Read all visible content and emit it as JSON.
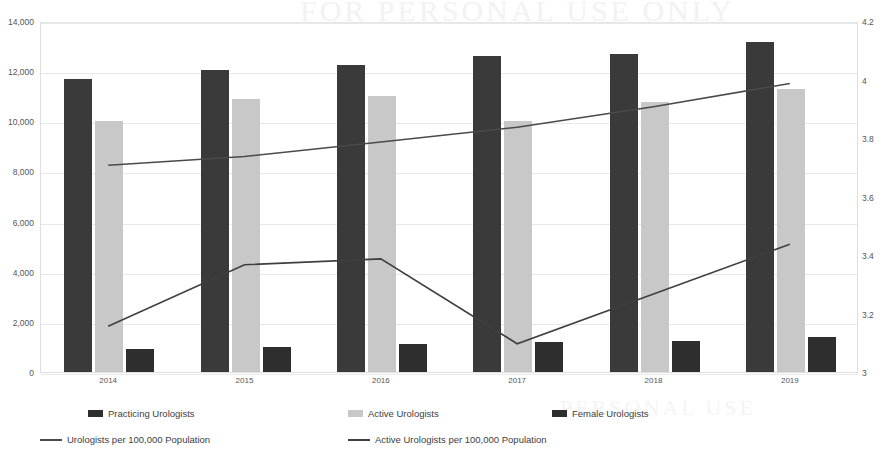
{
  "chart_data": {
    "type": "bar",
    "title": "",
    "xlabel": "",
    "ylabel": "",
    "categories": [
      "2014",
      "2015",
      "2016",
      "2017",
      "2018",
      "2019"
    ],
    "grid": true,
    "legend_position": "bottom",
    "axes": {
      "left": {
        "label": "",
        "ylim": [
          0,
          14000
        ],
        "ticks": [
          "0",
          "2,000",
          "4,000",
          "6,000",
          "8,000",
          "10,000",
          "12,000",
          "14,000"
        ],
        "tick_values": [
          0,
          2000,
          4000,
          6000,
          8000,
          10000,
          12000,
          14000
        ]
      },
      "right": {
        "label": "",
        "ylim": [
          3,
          4.2
        ],
        "ticks": [
          "3",
          "3.2",
          "3.4",
          "3.6",
          "3.8",
          "4",
          "4.2"
        ],
        "tick_values": [
          3,
          3.2,
          3.4,
          3.6,
          3.8,
          4.0,
          4.2
        ]
      }
    },
    "series": [
      {
        "name": "Practicing Urologists",
        "type": "bar",
        "axis": "left",
        "color": "#3a3a3a",
        "values": [
          11700,
          12050,
          12250,
          12600,
          12700,
          13150
        ]
      },
      {
        "name": "Active Urologists",
        "type": "bar",
        "axis": "left",
        "color": "#c8c8c8",
        "values": [
          10000,
          10900,
          11000,
          10000,
          10750,
          11300
        ]
      },
      {
        "name": "Female Urologists",
        "type": "bar",
        "axis": "left",
        "color": "#2e2e2e",
        "values": [
          900,
          1000,
          1100,
          1200,
          1250,
          1400
        ]
      },
      {
        "name": "Urologists per 100,000 Population",
        "type": "line",
        "axis": "right",
        "color": "#4a4a4a",
        "values": [
          3.71,
          3.74,
          3.79,
          3.84,
          3.91,
          3.99
        ]
      },
      {
        "name": "Active Urologists per 100,000 Population",
        "type": "line",
        "axis": "right",
        "color": "#3f3f3f",
        "values": [
          3.16,
          3.37,
          3.39,
          3.1,
          3.27,
          3.44
        ]
      }
    ]
  },
  "legend": {
    "items": [
      {
        "label": "Practicing Urologists",
        "marker": "swatch",
        "color": "#2e2e2e"
      },
      {
        "label": "Active Urologists",
        "marker": "swatch",
        "color": "#c8c8c8"
      },
      {
        "label": "Female Urologists",
        "marker": "swatch",
        "color": "#2e2e2e"
      },
      {
        "label": "Urologists per 100,000 Population",
        "marker": "line",
        "color": "#4a4a4a"
      },
      {
        "label": "Active Urologists per 100,000 Population",
        "marker": "line",
        "color": "#3f3f3f"
      }
    ]
  },
  "watermark": {
    "top_text": "FOR PERSONAL USE ONLY",
    "bottom_text": "PERSONAL USE"
  }
}
